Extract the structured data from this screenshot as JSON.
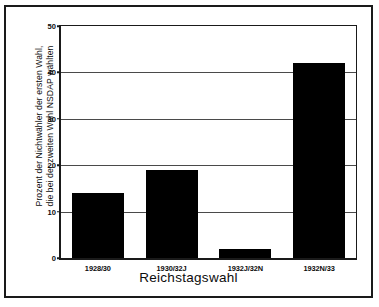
{
  "chart_data": {
    "type": "bar",
    "title": "",
    "categories": [
      "1928/30",
      "1930/32J",
      "1932J/32N",
      "1932N/33"
    ],
    "values": [
      14,
      19,
      2,
      42
    ],
    "series": [
      {
        "name": "Prozent der Nichtwähler der ersten Wahl, die bei der zweiten Wahl NSDAP wählten",
        "values": [
          14,
          19,
          2,
          42
        ]
      }
    ],
    "xlabel": "Reichstagswahl",
    "ylabel_line1": "Prozent der Nichtwähler der ersten Wahl,",
    "ylabel_line2": "die bei der zweiten Wahl NSDAP wählten",
    "ylim": [
      0,
      50
    ],
    "yticks": [
      0,
      10,
      20,
      30,
      40,
      50
    ],
    "ytick_labels": [
      "0",
      "10",
      "20",
      "30",
      "40",
      "50"
    ],
    "grid": true,
    "grid_axis": "y",
    "legend": "none",
    "bar_color": "#000000",
    "axis_color": "#1a1a1a",
    "background_color": "#ffffff"
  }
}
